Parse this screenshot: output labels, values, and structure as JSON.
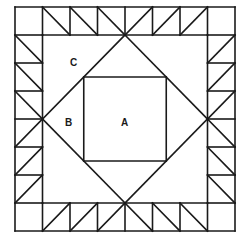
{
  "diagram": {
    "labels": {
      "a": "A",
      "b": "B",
      "c": "C"
    },
    "grid": {
      "cols": 8,
      "rows": 8
    },
    "border": {
      "top_row": [
        "corner",
        "\\",
        "\\",
        "\\",
        "/",
        "/",
        "/",
        "corner"
      ],
      "bottom_row": [
        "corner",
        "/",
        "/",
        "/",
        "\\",
        "\\",
        "\\",
        "corner"
      ],
      "left_col": [
        "\\",
        "\\",
        "\\",
        "/",
        "/",
        "/"
      ],
      "right_col": [
        "/",
        "/",
        "/",
        "\\",
        "\\",
        "\\"
      ]
    },
    "colors": {
      "line": "#1a1a1a",
      "background": "#ffffff"
    }
  }
}
